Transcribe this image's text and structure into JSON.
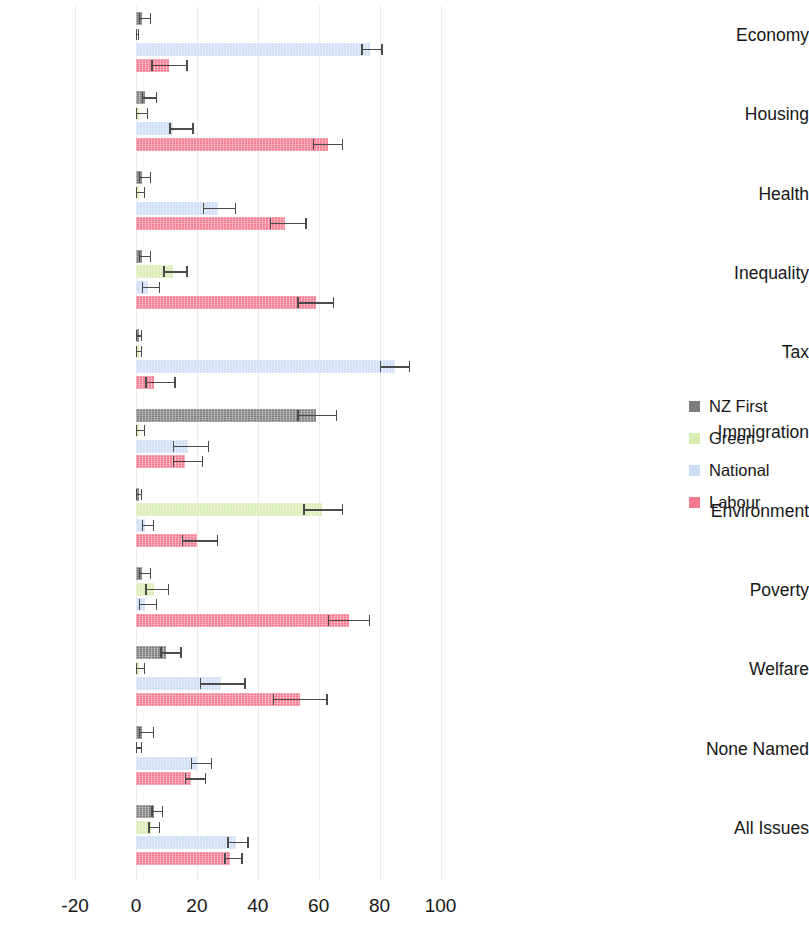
{
  "chart_data": {
    "type": "bar",
    "orientation": "horizontal",
    "title": "",
    "subtitle": "",
    "xlabel": "",
    "ylabel": "",
    "xlim": [
      -20,
      100
    ],
    "xticks": [
      -20,
      0,
      20,
      40,
      60,
      80,
      100
    ],
    "xticklabels": [
      "-20",
      "0",
      "20",
      "40",
      "60",
      "80",
      "100"
    ],
    "grid": true,
    "grid_axis": "x",
    "legend_position": "right",
    "error_bars": true,
    "categories": [
      "Economy",
      "Housing",
      "Health",
      "Inequality",
      "Tax",
      "Immigration",
      "Environment",
      "Poverty",
      "Welfare",
      "None Named",
      "All Issues"
    ],
    "series": [
      {
        "name": "NZ First",
        "color": "#7d7d7d",
        "values": [
          2,
          3,
          2,
          2,
          1,
          59,
          1,
          2,
          10,
          2,
          6
        ],
        "err_low": [
          1,
          2,
          1,
          1,
          0,
          53,
          0,
          1,
          8,
          1,
          5
        ],
        "err_high": [
          5,
          7,
          5,
          5,
          2,
          66,
          2,
          5,
          15,
          6,
          9
        ]
      },
      {
        "name": "Green",
        "color": "#d8ebb0",
        "values": [
          0,
          1,
          1,
          12,
          1,
          1,
          61,
          6,
          1,
          0.3,
          5
        ],
        "err_low": [
          0,
          0,
          0,
          9,
          0,
          0,
          55,
          3,
          0,
          0,
          4
        ],
        "err_high": [
          1,
          4,
          3,
          17,
          2,
          3,
          68,
          11,
          3,
          2,
          8
        ]
      },
      {
        "name": "National",
        "color": "#ccddf5",
        "values": [
          77,
          12,
          27,
          4,
          85,
          17,
          3,
          3,
          28,
          20,
          33
        ],
        "err_low": [
          74,
          11,
          22,
          2,
          80,
          12,
          2,
          1,
          21,
          18,
          30
        ],
        "err_high": [
          81,
          19,
          33,
          8,
          90,
          24,
          6,
          7,
          36,
          25,
          37
        ]
      },
      {
        "name": "Labour",
        "color": "#f5798e",
        "values": [
          11,
          63,
          49,
          59,
          6,
          16,
          20,
          70,
          54,
          18,
          31
        ]
      }
    ],
    "labour_err_low": [
      5,
      58,
      44,
      53,
      3,
      12,
      15,
      63,
      45,
      16,
      29
    ],
    "labour_err_high": [
      17,
      68,
      56,
      65,
      13,
      22,
      27,
      77,
      63,
      23,
      35
    ],
    "legend": [
      {
        "label": "NZ First",
        "color": "#7d7d7d"
      },
      {
        "label": "Green",
        "color": "#d8ebb0"
      },
      {
        "label": "National",
        "color": "#ccddf5"
      },
      {
        "label": "Labour",
        "color": "#f5798e"
      }
    ]
  }
}
